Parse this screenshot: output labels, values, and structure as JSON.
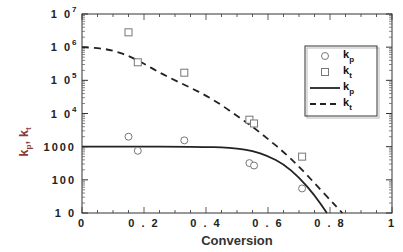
{
  "chart_data": {
    "type": "scatter",
    "title": "",
    "xlabel": "Conversion",
    "ylabel": "k_p, k_t",
    "xlim": [
      0,
      1
    ],
    "ylim": [
      10,
      10000000
    ],
    "yscale": "log",
    "grid": false,
    "legend_position": "upper right",
    "x_ticks": [
      "0",
      "0.2",
      "0.4",
      "0.6",
      "0.8",
      "1"
    ],
    "y_ticks": [
      "10",
      "100",
      "1000",
      "10^4",
      "10^5",
      "10^6",
      "10^7"
    ],
    "series": [
      {
        "name": "k_p",
        "kind": "markers",
        "marker": "circle",
        "x": [
          0.15,
          0.18,
          0.33,
          0.54,
          0.555,
          0.71
        ],
        "y": [
          2000,
          750,
          1550,
          320,
          270,
          55
        ]
      },
      {
        "name": "k_t",
        "kind": "markers",
        "marker": "square",
        "x": [
          0.15,
          0.18,
          0.33,
          0.54,
          0.555,
          0.71
        ],
        "y": [
          2800000,
          350000,
          170000,
          6500,
          5000,
          500
        ]
      },
      {
        "name": "k_p",
        "kind": "line",
        "style": "solid",
        "x": [
          0,
          0.1,
          0.2,
          0.3,
          0.4,
          0.45,
          0.5,
          0.55,
          0.6,
          0.65,
          0.7,
          0.75,
          0.79
        ],
        "y": [
          1000,
          1000,
          1000,
          1000,
          980,
          950,
          880,
          750,
          520,
          300,
          120,
          35,
          10
        ]
      },
      {
        "name": "k_t",
        "kind": "line",
        "style": "dashed",
        "x": [
          0,
          0.05,
          0.1,
          0.15,
          0.2,
          0.25,
          0.3,
          0.35,
          0.4,
          0.45,
          0.5,
          0.55,
          0.6,
          0.65,
          0.7,
          0.75,
          0.8,
          0.84
        ],
        "y": [
          1000000,
          950000,
          800000,
          550000,
          320000,
          170000,
          100000,
          60000,
          35000,
          18000,
          8500,
          4000,
          1700,
          700,
          250,
          80,
          25,
          10
        ]
      }
    ]
  },
  "axes": {
    "x_title": "Conversion",
    "y_title_main": "k",
    "y_title_sub1": "p",
    "y_title_sep": ", k",
    "y_title_sub2": "t",
    "x_ticks": [
      "0",
      "0.2",
      "0.4",
      "0.6",
      "0.8",
      "1"
    ],
    "y_ticks": [
      {
        "base": "1 0",
        "exp": "7"
      },
      {
        "base": "1 0",
        "exp": "6"
      },
      {
        "base": "1 0",
        "exp": "5"
      },
      {
        "base": "1 0",
        "exp": "4"
      },
      {
        "base": "1000",
        "exp": ""
      },
      {
        "base": "100",
        "exp": ""
      },
      {
        "base": "1 0",
        "exp": ""
      }
    ]
  },
  "legend": {
    "items": [
      {
        "symbol": "circle",
        "label": "k",
        "sub": "p"
      },
      {
        "symbol": "square",
        "label": "k",
        "sub": "t"
      },
      {
        "symbol": "solid-line",
        "label": "k",
        "sub": "p"
      },
      {
        "symbol": "dashed-line",
        "label": "k",
        "sub": "t"
      }
    ]
  },
  "colors": {
    "axis": "#333333",
    "data": "#222222",
    "marker": "#777777",
    "ylabel": "#8a3a3a"
  }
}
